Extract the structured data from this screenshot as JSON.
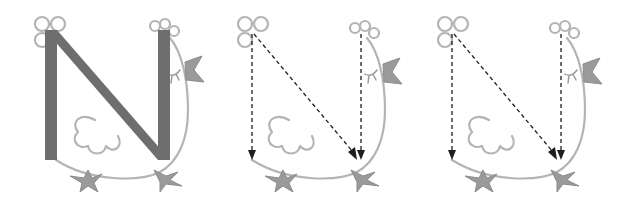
{
  "figure": {
    "subject": "Letter N shaped like a chicken",
    "panels": [
      {
        "id": 1,
        "style": "solid-letter",
        "letter": "N",
        "letter_color": "#6e6e6e"
      },
      {
        "id": 2,
        "style": "dashed-stroke-guide",
        "strokes": [
          "down-left",
          "diagonal",
          "down-right"
        ]
      },
      {
        "id": 3,
        "style": "dashed-stroke-guide",
        "strokes": [
          "down-left",
          "diagonal",
          "down-right"
        ]
      }
    ],
    "colors": {
      "outline": "#b4b4b4",
      "letter": "#6e6e6e",
      "beak_feet": "#9a9a9a",
      "guide": "#1e1e1e",
      "background": "#ffffff"
    }
  }
}
